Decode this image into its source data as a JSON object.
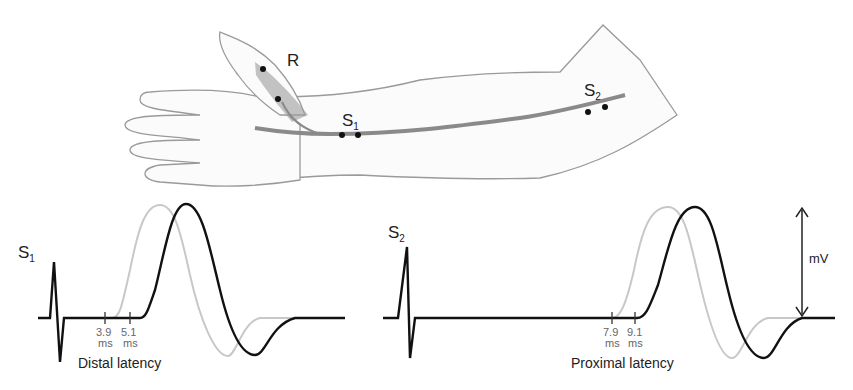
{
  "illustration": {
    "recording_label": "R",
    "stim1_label": "S",
    "stim1_sub": "1",
    "stim2_label": "S",
    "stim2_sub": "2"
  },
  "traces": {
    "distal": {
      "label": "S",
      "label_sub": "1",
      "tick1_value": "3.9",
      "tick1_unit": "ms",
      "tick2_value": "5.1",
      "tick2_unit": "ms",
      "caption": "Distal latency"
    },
    "proximal": {
      "label": "S",
      "label_sub": "2",
      "tick1_value": "7.9",
      "tick1_unit": "ms",
      "tick2_value": "9.1",
      "tick2_unit": "ms",
      "caption": "Proximal latency"
    },
    "amplitude_label": "mV"
  },
  "colors": {
    "normal_trace": "#c8c8c8",
    "delayed_trace": "#111111",
    "nerve": "#8a8a8a"
  }
}
